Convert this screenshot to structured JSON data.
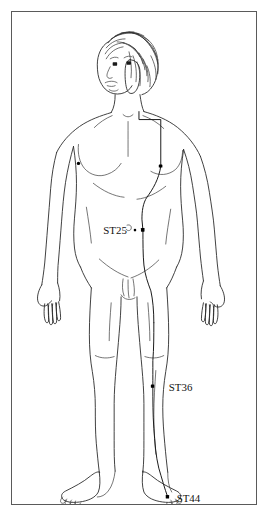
{
  "diagram": {
    "background_color": "#ffffff",
    "frame_color": "#5a5a5a",
    "line_color": "#2b2b2b",
    "meridian_color": "#1a1a1a",
    "point_color": "#000000",
    "view": "anterior",
    "labels": [
      {
        "id": "st25",
        "text": "ST25",
        "x": 92,
        "y": 222,
        "point_x": 132,
        "point_y": 219
      },
      {
        "id": "st36",
        "text": "ST36",
        "x": 158,
        "y": 381,
        "point_x": 142,
        "point_y": 376
      },
      {
        "id": "st44",
        "text": "ST44",
        "x": 166,
        "y": 491,
        "point_x": 157,
        "point_y": 487
      }
    ],
    "acupoints": [
      {
        "id": "st17-right",
        "x": 150,
        "y": 155
      },
      {
        "id": "st25",
        "x": 132,
        "y": 219
      },
      {
        "id": "st36",
        "x": 142,
        "y": 376
      },
      {
        "id": "st44",
        "x": 157,
        "y": 487
      }
    ],
    "anatomy_markers": [
      {
        "id": "left-nipple",
        "x": 67,
        "y": 152
      },
      {
        "id": "left-eye",
        "x": 104,
        "y": 53
      },
      {
        "id": "right-eye",
        "x": 118,
        "y": 52
      }
    ]
  }
}
